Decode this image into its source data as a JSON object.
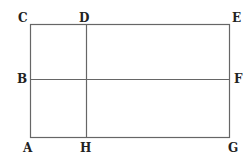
{
  "diagram": {
    "title": "",
    "line_color": "#666666",
    "label_color": "#222222",
    "rectangle": {
      "x": 30,
      "y": 24,
      "width": 199,
      "height": 113
    },
    "lines": [
      {
        "name": "vertical-line-dh",
        "from": "D",
        "to": "H",
        "x1": 86,
        "y1": 24,
        "x2": 86,
        "y2": 137
      },
      {
        "name": "horizontal-line-bf",
        "from": "B",
        "to": "F",
        "x1": 30,
        "y1": 79,
        "x2": 229,
        "y2": 79
      }
    ],
    "points": {
      "C": {
        "label": "C",
        "x": 30,
        "y": 24
      },
      "D": {
        "label": "D",
        "x": 86,
        "y": 24
      },
      "E": {
        "label": "E",
        "x": 229,
        "y": 24
      },
      "B": {
        "label": "B",
        "x": 30,
        "y": 79
      },
      "F": {
        "label": "F",
        "x": 229,
        "y": 79
      },
      "A": {
        "label": "A",
        "x": 30,
        "y": 137
      },
      "H": {
        "label": "H",
        "x": 86,
        "y": 137
      },
      "G": {
        "label": "G",
        "x": 229,
        "y": 137
      }
    }
  }
}
